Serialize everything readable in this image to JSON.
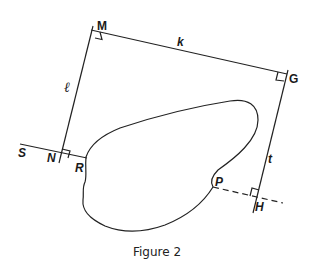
{
  "figure": {
    "caption": "Figure 2",
    "points": {
      "M": "M",
      "G": "G",
      "N": "N",
      "S": "S",
      "R": "R",
      "P": "P",
      "H": "H"
    },
    "segments": {
      "k": "k",
      "l": "ℓ",
      "t": "t"
    },
    "colors": {
      "stroke": "#222222",
      "background": "#ffffff"
    }
  }
}
